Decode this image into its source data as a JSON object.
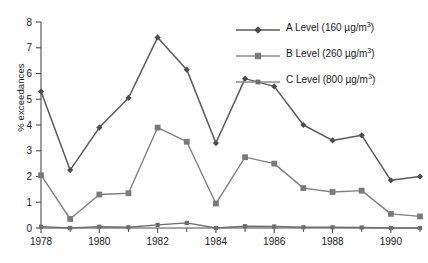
{
  "chart_data": {
    "type": "line",
    "title": "",
    "xlabel": "",
    "ylabel": "% exceedances",
    "xlim": [
      1978,
      1991
    ],
    "ylim": [
      0,
      8
    ],
    "yticks": [
      0,
      1,
      2,
      3,
      4,
      5,
      6,
      7,
      8
    ],
    "xticks_major": [
      1978,
      1980,
      1982,
      1984,
      1986,
      1988,
      1990
    ],
    "xticks_minor": [
      1979,
      1981,
      1983,
      1985,
      1987,
      1989,
      1991
    ],
    "grid": false,
    "legend_position": "top-right",
    "x": [
      1978,
      1979,
      1980,
      1981,
      1982,
      1983,
      1984,
      1985,
      1986,
      1987,
      1988,
      1989,
      1990,
      1991
    ],
    "series": [
      {
        "name": "A Level (160 µg/m3)",
        "label_main": "A Level (160 µg/m",
        "label_sup": "3",
        "label_tail": ")",
        "marker": "diamond",
        "color": "#595959",
        "values": [
          5.3,
          2.25,
          3.9,
          5.05,
          7.4,
          6.15,
          3.3,
          5.8,
          5.5,
          4.0,
          3.4,
          3.6,
          1.85,
          2.0
        ]
      },
      {
        "name": "B Level (260 µg/m3)",
        "label_main": "B Level (260 µg/m",
        "label_sup": "3",
        "label_tail": ")",
        "marker": "square",
        "color": "#808080",
        "values": [
          2.05,
          0.35,
          1.3,
          1.35,
          3.9,
          3.35,
          0.95,
          2.75,
          2.5,
          1.55,
          1.4,
          1.45,
          0.55,
          0.45
        ]
      },
      {
        "name": "C Level (800 µg/m3)",
        "label_main": "C Level (800 µg/m",
        "label_sup": "3",
        "label_tail": ")",
        "marker": "small-square",
        "color": "#6e6e6e",
        "values": [
          0.05,
          0.0,
          0.05,
          0.03,
          0.12,
          0.2,
          0.0,
          0.07,
          0.06,
          0.03,
          0.03,
          0.02,
          0.0,
          0.0
        ]
      }
    ]
  },
  "axis": {
    "y_label": "% exceedances",
    "y_tick_labels": [
      "0",
      "1",
      "2",
      "3",
      "4",
      "5",
      "6",
      "7",
      "8"
    ],
    "x_tick_labels": [
      "1978",
      "1980",
      "1982",
      "1984",
      "1986",
      "1988",
      "1990"
    ]
  }
}
